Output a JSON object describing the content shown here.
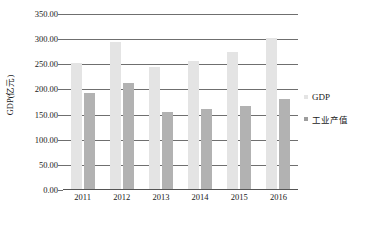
{
  "chart_data": {
    "type": "bar",
    "title": "",
    "xlabel": "",
    "ylabel": "GDP(亿元)",
    "categories": [
      "2011",
      "2012",
      "2013",
      "2014",
      "2015",
      "2016"
    ],
    "series": [
      {
        "name": "GDP",
        "color": "#e4e4e4",
        "values": [
          252,
          294,
          244,
          257,
          274,
          303
        ]
      },
      {
        "name": "工业产值",
        "color": "#b2b2b2",
        "values": [
          192,
          212,
          156,
          161,
          167,
          181
        ]
      }
    ],
    "ylim": [
      0,
      350
    ],
    "ytick_values": [
      0,
      50,
      100,
      150,
      200,
      250,
      300,
      350
    ],
    "ytick_labels": [
      "0.00",
      "50.00",
      "100.00",
      "150.00",
      "200.00",
      "250.00",
      "300.00",
      "350.00"
    ],
    "grid": true,
    "legend_position": "right"
  },
  "legend": {
    "entries": [
      {
        "label": "GDP"
      },
      {
        "label": "工业产值"
      }
    ]
  }
}
